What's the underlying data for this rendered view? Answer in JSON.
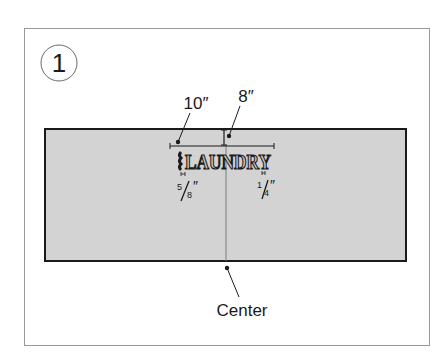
{
  "step": {
    "number": "1"
  },
  "dimensions": {
    "width_label": "10″",
    "offset_label": "8″",
    "left_spacing_num": "5",
    "left_spacing_den": "8",
    "left_spacing_unit": "″",
    "right_spacing_num": "1",
    "right_spacing_den": "4",
    "right_spacing_unit": "″"
  },
  "design": {
    "word": "LAUNDRY"
  },
  "callouts": {
    "center_label": "Center"
  },
  "colors": {
    "panel_fill": "#d3d3d3",
    "panel_border": "#1a1a1a",
    "frame_border": "#9a9a9a",
    "ink": "#1a1a1a",
    "center_line": "#7a7a7a"
  }
}
